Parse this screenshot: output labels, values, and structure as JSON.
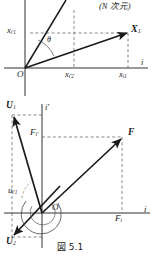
{
  "figure": {
    "caption": "図 5.1",
    "annotation_top_right": "(N 次元)",
    "panels": [
      {
        "name": "upper-panel",
        "origin_label": "O",
        "axis_horizontal_label": "i",
        "axis_vertical_label": "i'",
        "angle_label": "θ",
        "vectors": [
          {
            "name": "X1",
            "label": "X",
            "subscript": "1",
            "bold": true
          },
          {
            "name": "rotated-axis-vector",
            "label": "",
            "subscript": "",
            "bold": false
          }
        ],
        "tick_labels": [
          {
            "name": "x-i-prime-1",
            "base": "x",
            "sub": "i'1",
            "position": "left-axis"
          },
          {
            "name": "x-i-prime-2",
            "base": "x",
            "sub": "i'2",
            "position": "bottom-axis-mid"
          },
          {
            "name": "x-i-1",
            "base": "x",
            "sub": "i1",
            "position": "bottom-axis-right"
          }
        ]
      },
      {
        "name": "lower-panel",
        "origin_label": "O",
        "axis_horizontal_label": "i",
        "axis_vertical_label": "i'",
        "vectors": [
          {
            "name": "U1",
            "label": "U",
            "subscript": "1",
            "bold": true
          },
          {
            "name": "U2",
            "label": "U",
            "subscript": "2",
            "bold": true
          },
          {
            "name": "F",
            "label": "F",
            "subscript": "",
            "bold": true
          }
        ],
        "tick_labels": [
          {
            "name": "F-i-prime",
            "base": "F",
            "sub": "i'",
            "position": "left-upper"
          },
          {
            "name": "F-i",
            "base": "F",
            "sub": "i",
            "position": "bottom-right"
          },
          {
            "name": "u-i-prime-1",
            "base": "u",
            "sub": "i'1",
            "position": "left-lower"
          }
        ]
      }
    ]
  },
  "labels": {
    "n_dim": "(N 次元)",
    "theta": "θ",
    "origin_upper": "O",
    "origin_lower": "O",
    "axis_i_upper": "i",
    "axis_i_lower": "i",
    "axis_iprime_upper": "i'",
    "axis_iprime_lower": "i'",
    "X1_base": "X",
    "X1_sub": "1",
    "xi1_base": "x",
    "xi1_sub": "i1",
    "xip1_base": "x",
    "xip1_sub": "i'1",
    "xip2_base": "x",
    "xip2_sub": "i'2",
    "U1_base": "U",
    "U1_sub": "1",
    "U2_base": "U",
    "U2_sub": "2",
    "F_base": "F",
    "Fip_base": "F",
    "Fip_sub": "i'",
    "Fi_base": "F",
    "Fi_sub": "i",
    "uip1_base": "u",
    "uip1_sub": "i'1",
    "caption": "図 5.1"
  },
  "colors": {
    "ink": "#1a1a1a",
    "dashed": "#555555",
    "background": "#ffffff"
  }
}
